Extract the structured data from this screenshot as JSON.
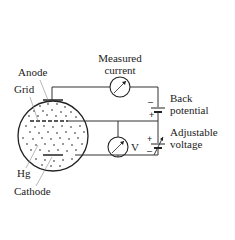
{
  "diagram": {
    "labels": {
      "anode": "Anode",
      "grid": "Grid",
      "hg": "Hg",
      "cathode": "Cathode",
      "measured_current_line1": "Measured",
      "measured_current_line2": "current",
      "back_potential_line1": "Back",
      "back_potential_line2": "potential",
      "adjustable_voltage_line1": "Adjustable",
      "adjustable_voltage_line2": "voltage",
      "voltmeter": "V"
    },
    "signs": {
      "back_potential_top": "–",
      "back_potential_bottom": "+",
      "adjustable_top": "+",
      "adjustable_bottom": "–"
    },
    "colors": {
      "line": "#333333",
      "text": "#222222",
      "dots": "#777777",
      "background": "#ffffff"
    }
  }
}
